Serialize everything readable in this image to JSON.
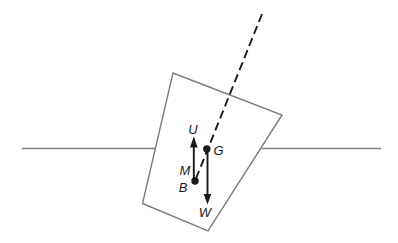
{
  "diagram": {
    "type": "physics-ship-stability-diagram",
    "labels": {
      "upthrust": "U",
      "gravity": "G",
      "metacentre": "M",
      "buoyancy": "B",
      "weight": "W"
    },
    "colors": {
      "background": "#ffffff",
      "outline_gray": "#838383",
      "ink_black": "#1a1a1a"
    }
  }
}
